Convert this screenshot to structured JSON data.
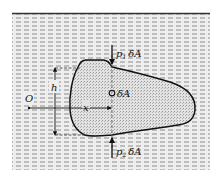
{
  "diagram": {
    "colors": {
      "background": "#ffffff",
      "liquid_hatch": "#8c8c8c",
      "liquid_fill": "#e9e9e9",
      "body_fill": "#dcdcdc",
      "outline": "#111111"
    },
    "labels": {
      "top_force": "p₁ δA",
      "top_force_p": "p",
      "top_force_sub": "1",
      "top_force_area": "δA",
      "bottom_force": "p₂ δA",
      "bottom_force_p": "p",
      "bottom_force_sub": "2",
      "bottom_force_area": "δA",
      "element": "δA",
      "height": "h",
      "horizontal_distance": "x",
      "origin": "O"
    },
    "icons": {
      "element_marker": "small-circle",
      "force_arrows": "arrow-down / arrow-up"
    }
  }
}
